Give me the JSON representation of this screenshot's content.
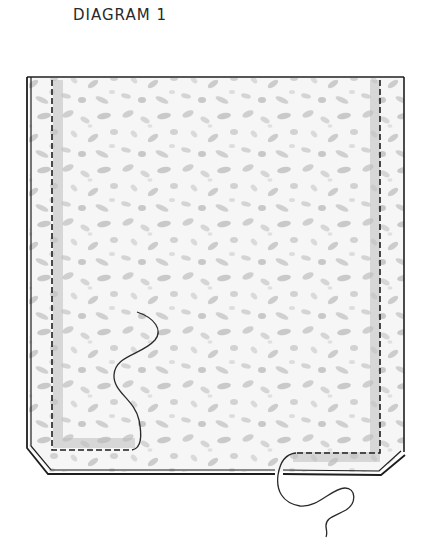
{
  "title": "DIAGRAM 1",
  "diagram": {
    "colors": {
      "background": "#ffffff",
      "outline": "#1e1e1e",
      "fabric_light": "#f4f4f4",
      "fabric_speckle": "#c9c9c9",
      "seam_shadow": "#bdbdbd",
      "thread": "#2a2a2a"
    },
    "elements": [
      {
        "name": "fabric-panel",
        "description": "speckled fabric with chamfered bottom corners"
      },
      {
        "name": "outer-edge-double-line",
        "description": "double outline along left, bottom and right edges"
      },
      {
        "name": "stitch-line-left",
        "description": "dashed stitch line along left side turning at bottom"
      },
      {
        "name": "stitch-line-right",
        "description": "dashed stitch line along right side turning at bottom"
      },
      {
        "name": "thread-end-left",
        "description": "loose thread rising from left stitch end"
      },
      {
        "name": "thread-end-right",
        "description": "loose thread descending below bottom edge"
      }
    ]
  }
}
